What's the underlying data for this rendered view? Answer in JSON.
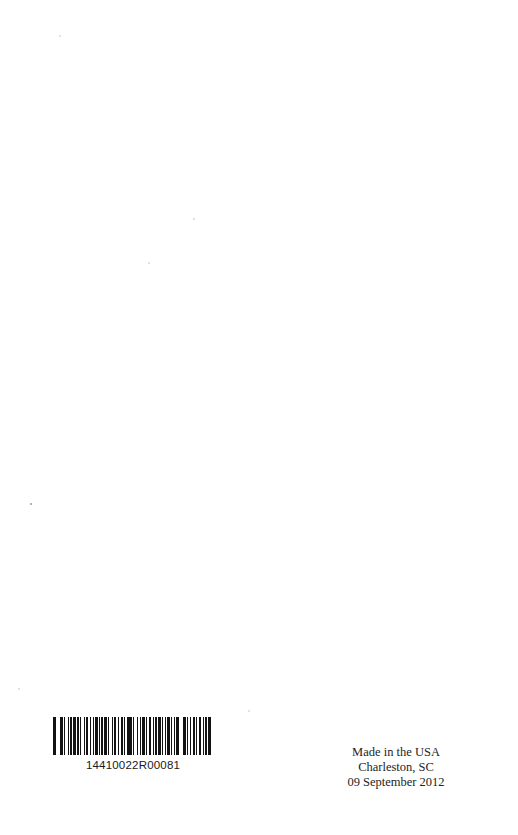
{
  "page": {
    "background_color": "#ffffff",
    "width": 518,
    "height": 835
  },
  "barcode": {
    "number": "14410022R00081",
    "bar_color": "#050505",
    "pattern": [
      3,
      2,
      1,
      2,
      3,
      1,
      1,
      3,
      2,
      1,
      2,
      1,
      3,
      1,
      2,
      2,
      1,
      3,
      1,
      1,
      2,
      3,
      1,
      2,
      1,
      1,
      3,
      2,
      1,
      1,
      2,
      1,
      3,
      1,
      2,
      3,
      1,
      1,
      2,
      2,
      1,
      3,
      2,
      1,
      1,
      2,
      3,
      1,
      2,
      1,
      1,
      3,
      1,
      2,
      2,
      1,
      3,
      1,
      1,
      2,
      3,
      2,
      1,
      1,
      2,
      1,
      3,
      2,
      1,
      2,
      1,
      1,
      3,
      1,
      2,
      2,
      1,
      1,
      3,
      2,
      1,
      2,
      3,
      1,
      1,
      2,
      1,
      3,
      2,
      1,
      1,
      2,
      2,
      3,
      1,
      1,
      2,
      1,
      3,
      2
    ]
  },
  "imprint": {
    "line1": "Made in the USA",
    "line2": "Charleston, SC",
    "line3": "09 September 2012"
  }
}
